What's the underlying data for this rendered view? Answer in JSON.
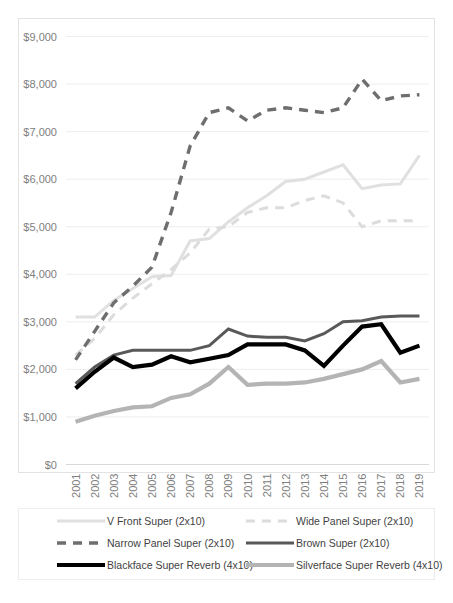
{
  "chart_data": {
    "type": "line",
    "title": "",
    "xlabel": "",
    "ylabel": "",
    "x": [
      2001,
      2002,
      2003,
      2004,
      2005,
      2006,
      2007,
      2008,
      2009,
      2010,
      2011,
      2012,
      2013,
      2014,
      2015,
      2016,
      2017,
      2018,
      2019
    ],
    "categories": [
      "2001",
      "2002",
      "2003",
      "2004",
      "2005",
      "2006",
      "2007",
      "2008",
      "2009",
      "2010",
      "2011",
      "2012",
      "2013",
      "2014",
      "2015",
      "2016",
      "2017",
      "2018",
      "2019"
    ],
    "ylim": [
      0,
      9000
    ],
    "ytick_values": [
      0,
      1000,
      2000,
      3000,
      4000,
      5000,
      6000,
      7000,
      8000,
      9000
    ],
    "ytick_labels": [
      "$0",
      "$1,000",
      "$2,000",
      "$3,000",
      "$4,000",
      "$5,000",
      "$6,000",
      "$7,000",
      "$8,000",
      "$9,000"
    ],
    "grid": true,
    "legend_position": "bottom",
    "series": [
      {
        "name": "V Front Super (2x10)",
        "color": "#e0e0e0",
        "width": 3,
        "dash": "none",
        "values": [
          3100,
          3100,
          3450,
          3700,
          3950,
          3975,
          4700,
          4750,
          5100,
          5400,
          5650,
          5950,
          6000,
          6150,
          6300,
          5800,
          5875,
          5900,
          6500
        ]
      },
      {
        "name": "Wide Panel Super (2x10)",
        "color": "#dcdcdc",
        "width": 3,
        "dash": "9,7",
        "values": [
          2300,
          2650,
          3150,
          3500,
          3800,
          4100,
          4450,
          4950,
          5000,
          5300,
          5400,
          5400,
          5550,
          5650,
          5500,
          5000,
          5125,
          5125,
          5125
        ]
      },
      {
        "name": "Narrow Panel Super (2x10)",
        "color": "#6e6e6e",
        "width": 3.4,
        "dash": "9,7",
        "values": [
          2200,
          2800,
          3400,
          3750,
          4150,
          5300,
          6700,
          7400,
          7500,
          7225,
          7450,
          7500,
          7450,
          7400,
          7500,
          8100,
          7650,
          7750,
          7775
        ]
      },
      {
        "name": "Brown Super (2x10)",
        "color": "#595959",
        "width": 3,
        "dash": "none",
        "values": [
          1700,
          2050,
          2300,
          2400,
          2400,
          2400,
          2400,
          2500,
          2850,
          2700,
          2675,
          2675,
          2600,
          2750,
          3000,
          3025,
          3100,
          3125,
          3125
        ]
      },
      {
        "name": "Blackface Super Reverb (4x10)",
        "color": "#000000",
        "width": 4.2,
        "dash": "none",
        "values": [
          1600,
          1950,
          2250,
          2050,
          2100,
          2275,
          2150,
          2225,
          2300,
          2525,
          2525,
          2525,
          2400,
          2075,
          2500,
          2900,
          2950,
          2350,
          2500
        ]
      },
      {
        "name": "Silverface Super Reverb (4x10)",
        "color": "#b4b4b4",
        "width": 4.2,
        "dash": "none",
        "values": [
          900,
          1025,
          1125,
          1200,
          1225,
          1400,
          1475,
          1700,
          2050,
          1675,
          1700,
          1700,
          1725,
          1800,
          1900,
          2000,
          2175,
          1725,
          1800
        ]
      }
    ]
  },
  "legend": {
    "entries": [
      {
        "label": "V Front Super (2x10)"
      },
      {
        "label": "Wide Panel Super (2x10)"
      },
      {
        "label": "Narrow Panel Super (2x10)"
      },
      {
        "label": "Brown Super (2x10)"
      },
      {
        "label": "Blackface Super Reverb (4x10)"
      },
      {
        "label": "Silverface Super Reverb (4x10)"
      }
    ]
  }
}
